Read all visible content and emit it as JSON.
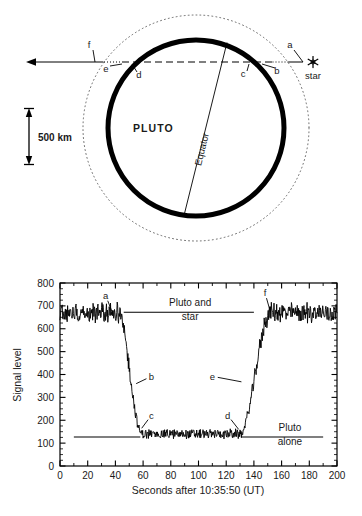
{
  "figure": {
    "background_color": "#ffffff",
    "ink_color": "#000000"
  },
  "diagram": {
    "body_label": "PLUTO",
    "equator_label": "Equator",
    "star_label": "star",
    "star_icon": "six-pointed-star-icon",
    "scale_bar_label": "500 km",
    "surface_circle": {
      "cx": 196,
      "cy": 128,
      "r": 88,
      "stroke": "#000000",
      "stroke_width": 5
    },
    "atmosphere_circle": {
      "cx": 196,
      "cy": 128,
      "r": 113,
      "stroke": "#555555",
      "dotted": true
    },
    "occultation_chord_y": 62,
    "arrow_direction": "left",
    "points": [
      {
        "id": "a",
        "label": "a",
        "lx": 290,
        "ly": 48,
        "tx": 303,
        "ty": 62
      },
      {
        "id": "b",
        "label": "b",
        "lx": 277,
        "ly": 74,
        "tx": 262,
        "ty": 64
      },
      {
        "id": "c",
        "label": "c",
        "lx": 243,
        "ly": 77,
        "tx": 249,
        "ty": 64
      },
      {
        "id": "d",
        "label": "d",
        "lx": 139,
        "ly": 78,
        "tx": 132,
        "ty": 64
      },
      {
        "id": "e",
        "label": "e",
        "lx": 106,
        "ly": 72,
        "tx": 122,
        "ty": 64
      },
      {
        "id": "f",
        "label": "f",
        "lx": 89,
        "ly": 48,
        "tx": 95,
        "ty": 62
      }
    ]
  },
  "chart_data": {
    "type": "line",
    "title": "",
    "xlabel": "Seconds after 10:35:50 (UT)",
    "ylabel": "Signal level",
    "xlim": [
      0,
      200
    ],
    "ylim": [
      0,
      800
    ],
    "xticks": [
      0,
      20,
      40,
      60,
      80,
      100,
      120,
      140,
      160,
      180,
      200
    ],
    "yticks": [
      0,
      100,
      200,
      300,
      400,
      500,
      600,
      700,
      800
    ],
    "x_minor_step": 10,
    "y_minor_step": 25,
    "grid": false,
    "legend_position": "inline-annotations",
    "series": [
      {
        "name": "Occultation light curve",
        "color": "#000000",
        "noise_amplitude_high": 38,
        "noise_amplitude_low": 18,
        "baseline_high": 670,
        "baseline_low": 140,
        "ingress_start_x": 42,
        "ingress_end_x": 59,
        "egress_start_x": 130,
        "egress_end_x": 152
      }
    ],
    "reference_lines": [
      {
        "name": "pluto-and-star-level",
        "y": 672,
        "x_start": 46,
        "x_end": 140
      },
      {
        "name": "pluto-alone-level-left",
        "y": 127,
        "x_start": 10,
        "x_end": 58
      },
      {
        "name": "pluto-alone-level-right",
        "y": 127,
        "x_start": 131,
        "x_end": 190
      }
    ],
    "annotations": [
      {
        "name": "pluto-and-star-label",
        "text_line1": "Pluto and",
        "text_line2": "star",
        "x": 94,
        "y": 700
      },
      {
        "name": "pluto-alone-label",
        "text_line1": "Pluto",
        "text_line2": "alone",
        "x": 166,
        "y": 155
      },
      {
        "id": "a",
        "label": "a",
        "x": 33,
        "y": 745,
        "px": 38,
        "py": 668
      },
      {
        "id": "b",
        "label": "b",
        "x": 66,
        "y": 392,
        "px": 55,
        "py": 360
      },
      {
        "id": "c",
        "label": "c",
        "x": 66,
        "y": 222,
        "px": 59,
        "py": 165
      },
      {
        "id": "d",
        "label": "d",
        "x": 121,
        "y": 222,
        "px": 129,
        "py": 160
      },
      {
        "id": "e",
        "label": "e",
        "x": 110,
        "y": 392,
        "px": 131,
        "py": 368
      },
      {
        "id": "f",
        "label": "f",
        "x": 148,
        "y": 757,
        "px": 152,
        "py": 672
      }
    ]
  }
}
